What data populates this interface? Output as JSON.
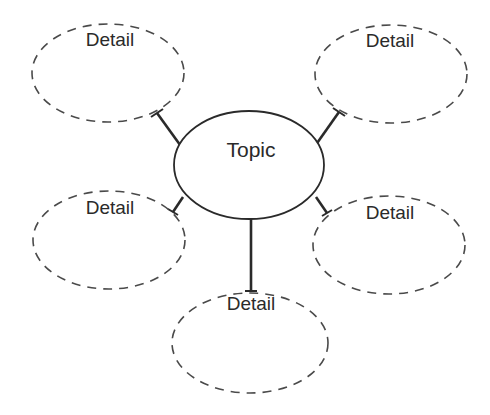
{
  "diagram": {
    "type": "concept-web",
    "line_color": "#2a2a2a",
    "dash_color": "#4a4a4a",
    "background": "#ffffff",
    "topic": {
      "label": "Topic",
      "shape": "ellipse",
      "border": "solid",
      "cx": 249,
      "cy": 165,
      "rx": 75,
      "ry": 54
    },
    "details": [
      {
        "id": "top-left",
        "label": "Detail",
        "cx": 108,
        "cy": 73,
        "rx": 76,
        "ry": 49
      },
      {
        "id": "top-right",
        "label": "Detail",
        "cx": 391,
        "cy": 74,
        "rx": 76,
        "ry": 49
      },
      {
        "id": "middle-left",
        "label": "Detail",
        "cx": 109,
        "cy": 240,
        "rx": 76,
        "ry": 49
      },
      {
        "id": "middle-right",
        "label": "Detail",
        "cx": 389,
        "cy": 245,
        "rx": 76,
        "ry": 49
      },
      {
        "id": "bottom",
        "label": "Detail",
        "cx": 250,
        "cy": 343,
        "rx": 78,
        "ry": 50
      }
    ],
    "connectors": [
      {
        "from": "topic",
        "to": "top-left"
      },
      {
        "from": "topic",
        "to": "top-right"
      },
      {
        "from": "topic",
        "to": "middle-left"
      },
      {
        "from": "topic",
        "to": "middle-right"
      },
      {
        "from": "topic",
        "to": "bottom"
      }
    ]
  }
}
